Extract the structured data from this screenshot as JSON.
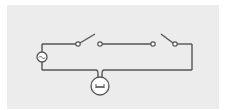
{
  "diagram": {
    "type": "circuit",
    "description": "Two-way (staircase) switch circuit with AC source and lamp",
    "colors": {
      "background": "#ffffff",
      "panel": "#ececec",
      "stroke": "#555555",
      "fill": "#ffffff"
    },
    "components": [
      {
        "id": "source",
        "kind": "ac-source",
        "symbol": "~",
        "x": 42,
        "y": 57,
        "r": 5
      },
      {
        "id": "switch-left",
        "kind": "switch",
        "state": "open",
        "pivot": [
          78,
          44
        ],
        "blade_end": [
          95,
          34
        ],
        "contact": [
          100,
          44
        ]
      },
      {
        "id": "switch-right",
        "kind": "switch",
        "state": "open",
        "contact": [
          153,
          44
        ],
        "blade_end": [
          161,
          34
        ],
        "pivot": [
          175,
          44
        ]
      },
      {
        "id": "lamp",
        "kind": "lamp",
        "x": 100,
        "y": 86,
        "r": 9
      }
    ],
    "wires": {
      "top_y": 44,
      "bottom_y": 70,
      "left_x": 42,
      "right_x": 192
    }
  }
}
